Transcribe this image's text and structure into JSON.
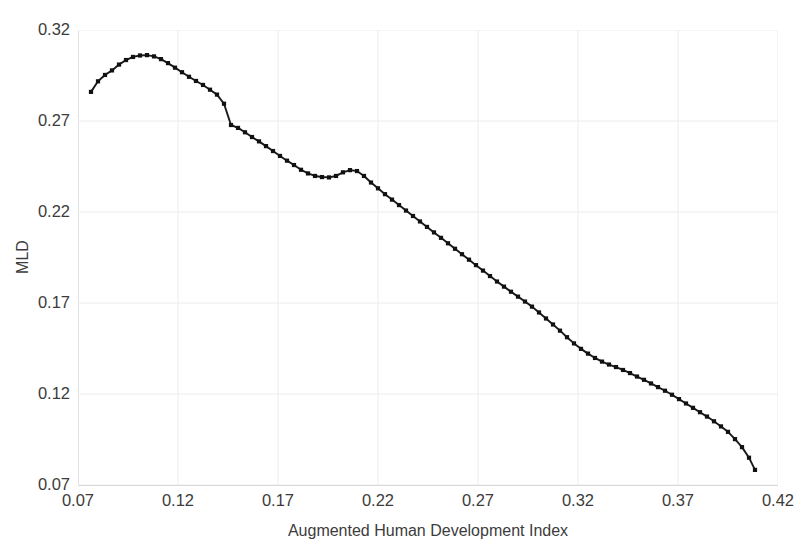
{
  "chart_data": {
    "type": "line",
    "title": "",
    "subtitle": "",
    "xlabel": "Augmented Human Development Index",
    "ylabel": "MLD",
    "xlim": [
      0.07,
      0.42
    ],
    "ylim": [
      0.07,
      0.32
    ],
    "xticks": [
      "0.07",
      "0.12",
      "0.17",
      "0.22",
      "0.27",
      "0.32",
      "0.37",
      "0.42"
    ],
    "yticks": [
      "0.07",
      "0.12",
      "0.17",
      "0.22",
      "0.27",
      "0.32"
    ],
    "grid": true,
    "legend": false,
    "legend_position": "none",
    "line_color": "#1a1a1a",
    "marker": "square",
    "marker_color": "#111111",
    "grid_color": "#ececec",
    "series": [
      {
        "name": "MLD vs Augmented Human Development Index",
        "x": [
          0.0765,
          0.08,
          0.0835,
          0.087,
          0.0905,
          0.094,
          0.0975,
          0.101,
          0.1045,
          0.108,
          0.1115,
          0.115,
          0.1185,
          0.122,
          0.1255,
          0.129,
          0.1325,
          0.136,
          0.1395,
          0.143,
          0.1465,
          0.15,
          0.1535,
          0.157,
          0.1605,
          0.164,
          0.1675,
          0.171,
          0.1745,
          0.178,
          0.1815,
          0.185,
          0.1885,
          0.192,
          0.1955,
          0.199,
          0.2025,
          0.206,
          0.2095,
          0.213,
          0.2165,
          0.22,
          0.2235,
          0.227,
          0.2305,
          0.234,
          0.2375,
          0.241,
          0.2445,
          0.248,
          0.2515,
          0.255,
          0.2585,
          0.262,
          0.2655,
          0.269,
          0.2725,
          0.276,
          0.2795,
          0.283,
          0.2865,
          0.29,
          0.2935,
          0.297,
          0.3005,
          0.304,
          0.3075,
          0.311,
          0.3145,
          0.318,
          0.3215,
          0.325,
          0.3285,
          0.332,
          0.3355,
          0.339,
          0.3425,
          0.346,
          0.3495,
          0.353,
          0.3565,
          0.36,
          0.3635,
          0.367,
          0.3705,
          0.374,
          0.3775,
          0.381,
          0.3845,
          0.388,
          0.3915,
          0.395,
          0.3985,
          0.402,
          0.4055,
          0.4085
        ],
        "y": [
          0.286,
          0.2918,
          0.2953,
          0.2978,
          0.301,
          0.3035,
          0.3052,
          0.306,
          0.3062,
          0.3055,
          0.304,
          0.3018,
          0.2993,
          0.2968,
          0.2943,
          0.292,
          0.2898,
          0.2872,
          0.2845,
          0.2795,
          0.2678,
          0.2662,
          0.2638,
          0.2612,
          0.2588,
          0.2562,
          0.2535,
          0.2508,
          0.2482,
          0.2458,
          0.2432,
          0.2412,
          0.2398,
          0.2392,
          0.239,
          0.2398,
          0.2418,
          0.243,
          0.2425,
          0.2398,
          0.2362,
          0.233,
          0.2298,
          0.2268,
          0.2238,
          0.2208,
          0.2178,
          0.2148,
          0.2118,
          0.2088,
          0.2058,
          0.2028,
          0.1998,
          0.1968,
          0.1938,
          0.1908,
          0.1878,
          0.1848,
          0.1818,
          0.179,
          0.1762,
          0.1735,
          0.1708,
          0.168,
          0.1648,
          0.1615,
          0.1582,
          0.1548,
          0.1512,
          0.1478,
          0.1448,
          0.1422,
          0.1398,
          0.1378,
          0.1362,
          0.1348,
          0.1332,
          0.1315,
          0.1296,
          0.1278,
          0.1258,
          0.1238,
          0.1218,
          0.1196,
          0.1172,
          0.1148,
          0.1124,
          0.11,
          0.1076,
          0.105,
          0.1022,
          0.0992,
          0.0952,
          0.0908,
          0.085,
          0.0783
        ]
      }
    ]
  }
}
